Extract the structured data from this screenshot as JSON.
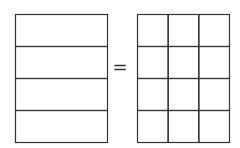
{
  "diagram": {
    "left_figure": {
      "rows": 4,
      "cols": 1,
      "label": "rectangle divided into 4 equal parts"
    },
    "operator": "=",
    "right_figure": {
      "rows": 4,
      "cols": 3,
      "label": "rectangle divided into 12 equal parts"
    },
    "stroke_color": "#333333"
  }
}
